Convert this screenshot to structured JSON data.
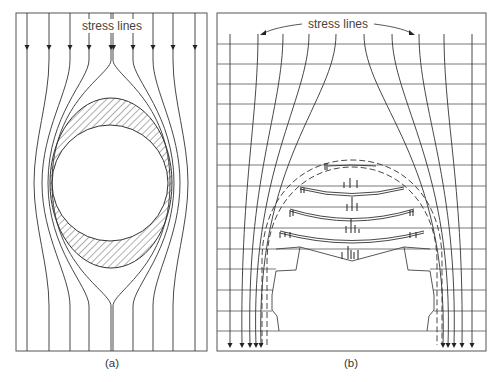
{
  "figure": {
    "panel_a": {
      "label": "stress lines",
      "caption": "(a)"
    },
    "panel_b": {
      "label": "stress lines",
      "caption": "(b)"
    },
    "colors": {
      "line": "#333333",
      "frame": "#555555",
      "grid": "#555555",
      "background": "#ffffff"
    }
  }
}
